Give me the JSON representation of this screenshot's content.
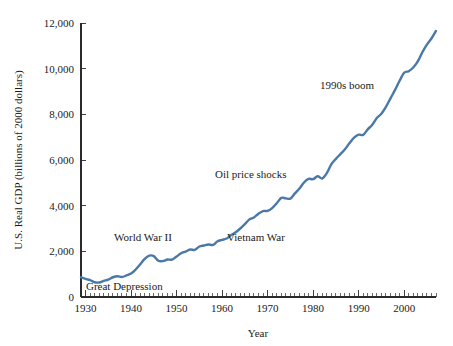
{
  "chart_data": {
    "type": "line",
    "title": "",
    "xlabel": "Year",
    "ylabel": "U.S. Real GDP (billions of 2000 dollars)",
    "xlim": [
      1929,
      2007
    ],
    "ylim": [
      0,
      12000
    ],
    "grid": false,
    "legend": "none",
    "line_color": "#4a78a8",
    "axis_color": "#2b2b2b",
    "x_tick_labels": [
      "1930",
      "1940",
      "1950",
      "1960",
      "1970",
      "1980",
      "1990",
      "2000"
    ],
    "x_tick_values": [
      1930,
      1940,
      1950,
      1960,
      1970,
      1980,
      1990,
      2000
    ],
    "x_minor_tick_interval": 1,
    "y_tick_labels": [
      "0",
      "2,000",
      "4,000",
      "6,000",
      "8,000",
      "10,000",
      "12,000"
    ],
    "y_tick_values": [
      0,
      2000,
      4000,
      6000,
      8000,
      10000,
      12000
    ],
    "series": [
      {
        "name": "U.S. Real GDP",
        "x": [
          1929,
          1930,
          1931,
          1932,
          1933,
          1934,
          1935,
          1936,
          1937,
          1938,
          1939,
          1940,
          1941,
          1942,
          1943,
          1944,
          1945,
          1946,
          1947,
          1948,
          1949,
          1950,
          1951,
          1952,
          1953,
          1954,
          1955,
          1956,
          1957,
          1958,
          1959,
          1960,
          1961,
          1962,
          1963,
          1964,
          1965,
          1966,
          1967,
          1968,
          1969,
          1970,
          1971,
          1972,
          1973,
          1974,
          1975,
          1976,
          1977,
          1978,
          1979,
          1980,
          1981,
          1982,
          1983,
          1984,
          1985,
          1986,
          1987,
          1988,
          1989,
          1990,
          1991,
          1992,
          1993,
          1994,
          1995,
          1996,
          1997,
          1998,
          1999,
          2000,
          2001,
          2002,
          2003,
          2004,
          2005,
          2006,
          2007
        ],
        "values": [
          865,
          790,
          740,
          645,
          635,
          705,
          765,
          865,
          910,
          875,
          945,
          1025,
          1205,
          1430,
          1670,
          1810,
          1790,
          1590,
          1575,
          1640,
          1635,
          1775,
          1915,
          1990,
          2080,
          2065,
          2210,
          2255,
          2300,
          2280,
          2440,
          2500,
          2560,
          2715,
          2835,
          3000,
          3190,
          3400,
          3485,
          3650,
          3765,
          3770,
          3895,
          4105,
          4340,
          4320,
          4310,
          4540,
          4750,
          5015,
          5175,
          5160,
          5290,
          5190,
          5425,
          5810,
          6050,
          6260,
          6470,
          6740,
          6980,
          7110,
          7100,
          7340,
          7540,
          7840,
          8030,
          8330,
          8700,
          9070,
          9470,
          9820,
          9890,
          10050,
          10320,
          10720,
          11050,
          11320,
          11650
        ]
      }
    ],
    "annotations": [
      {
        "text": "Great Depression",
        "x_px": 86,
        "y_px": 290,
        "anchor": "start"
      },
      {
        "text": "World War II",
        "x_px": 114,
        "y_px": 241,
        "anchor": "start"
      },
      {
        "text": "Vietnam War",
        "x_px": 227,
        "y_px": 241,
        "anchor": "start"
      },
      {
        "text": "Oil price shocks",
        "x_px": 215,
        "y_px": 178,
        "anchor": "start"
      },
      {
        "text": "1990s boom",
        "x_px": 320,
        "y_px": 89,
        "anchor": "start"
      }
    ]
  },
  "plot_geometry": {
    "left_px": 81,
    "right_px": 436,
    "top_px": 23,
    "bottom_px": 297
  }
}
